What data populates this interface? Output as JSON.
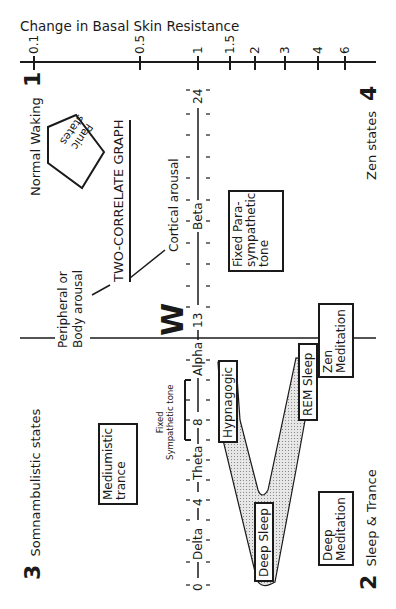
{
  "title": "Change in Basal Skin Resistance",
  "skin_axis": {
    "ticks": [
      {
        "label": "0.1",
        "x": 34
      },
      {
        "label": "0.5",
        "x": 140
      },
      {
        "label": "1",
        "x": 198
      },
      {
        "label": "1.5",
        "x": 230
      },
      {
        "label": "2",
        "x": 255
      },
      {
        "label": "3",
        "x": 285
      },
      {
        "label": "4",
        "x": 318
      },
      {
        "label": "6",
        "x": 345
      }
    ]
  },
  "eeg_axis": {
    "labels": [
      {
        "text": "24",
        "y": 95
      },
      {
        "text": "Beta",
        "y": 215
      },
      {
        "text": "13",
        "y": 318
      },
      {
        "text": "Alpha",
        "y": 356
      },
      {
        "text": "8",
        "y": 420
      },
      {
        "text": "Theta",
        "y": 460
      },
      {
        "text": "4",
        "y": 500
      },
      {
        "text": "Delta",
        "y": 540
      },
      {
        "text": "0",
        "y": 585
      }
    ]
  },
  "quadrants": {
    "q1": {
      "number": "1",
      "label": "Normal Waking"
    },
    "q2": {
      "number": "2",
      "label": "Sleep & Trance"
    },
    "q3": {
      "number": "3",
      "label": "Somnambulistic states"
    },
    "q4": {
      "number": "4",
      "label": "Zen states"
    }
  },
  "labels": {
    "graph_title": "TWO-CORRELATE GRAPH",
    "peripheral_1": "Peripheral or",
    "peripheral_2": "Body arousal",
    "cortical": "Cortical arousal",
    "w_mark": "W",
    "fixed_symp_1": "Fixed",
    "fixed_symp_2": "Sympathetic tone"
  },
  "boxes": {
    "panic_1": "Panic",
    "panic_2": "states",
    "fixed_para_1": "Fixed Para-",
    "fixed_para_2": "sympathetic",
    "fixed_para_3": "tone",
    "mediumistic_1": "Mediumistic",
    "mediumistic_2": "trance",
    "hypnagogic": "Hypnagogic",
    "rem_sleep": "REM Sleep",
    "deep_sleep": "Deep Sleep",
    "zen_med_1": "Zen",
    "zen_med_2": "Meditation",
    "deep_med_1": "Deep",
    "deep_med_2": "Meditation"
  },
  "colors": {
    "ink": "#1a1a1a",
    "shade": "#cfcfcf",
    "background": "#ffffff"
  }
}
